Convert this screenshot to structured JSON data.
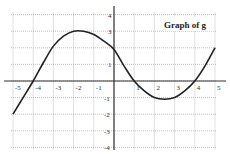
{
  "chart_data": {
    "type": "line",
    "title": "Graph of g",
    "xlabel": "",
    "ylabel": "",
    "xlim": [
      -5,
      5
    ],
    "ylim": [
      -4,
      4
    ],
    "grid": true,
    "x_ticks": [
      "-5",
      "-4",
      "-3",
      "-2",
      "-1",
      "1",
      "2",
      "3",
      "4",
      "5"
    ],
    "y_ticks": [
      "4",
      "3",
      "1",
      "-1",
      "-2",
      "-3",
      "-4"
    ],
    "series": [
      {
        "name": "g",
        "x": [
          -5,
          -4.5,
          -4,
          -3.5,
          -3,
          -2.5,
          -2,
          -1.5,
          -1,
          -0.5,
          0,
          0.5,
          1,
          1.5,
          2,
          2.5,
          3,
          3.5,
          4,
          4.5,
          5
        ],
        "y": [
          -2,
          -1,
          0,
          1.1,
          2.1,
          2.7,
          3,
          3,
          2.8,
          2.4,
          1.9,
          0.9,
          0,
          -0.6,
          -1,
          -1.1,
          -1,
          -0.6,
          0,
          0.9,
          2
        ]
      }
    ]
  },
  "colors": {
    "curve": "#222222",
    "grid": "#999999",
    "axis": "#333333"
  }
}
